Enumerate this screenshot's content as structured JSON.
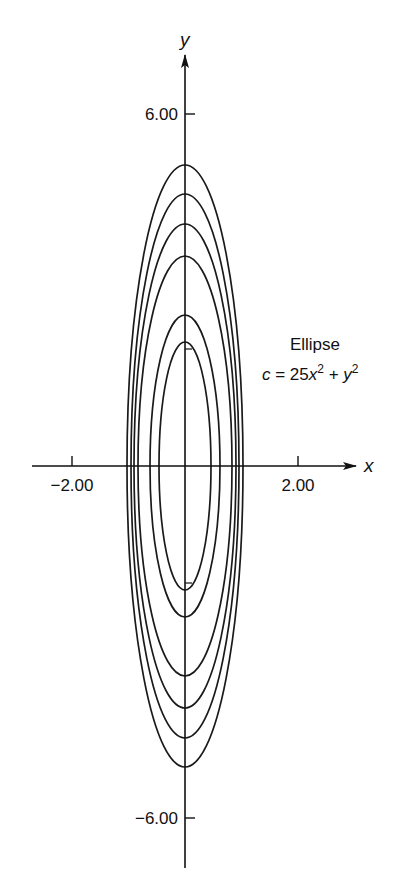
{
  "chart_data": {
    "type": "line",
    "subtype": "contour-ellipses",
    "title": "",
    "xlabel": "x",
    "ylabel": "y",
    "x_ticks": [
      {
        "value": -2.0,
        "label": "-2.00"
      },
      {
        "value": 2.0,
        "label": "2.00"
      }
    ],
    "y_ticks": [
      {
        "value": 6.0,
        "label": "6.00"
      },
      {
        "value": -6.0,
        "label": "-6.00"
      }
    ],
    "xlim": [
      -3.2,
      3.5
    ],
    "ylim": [
      -6.9,
      7.9
    ],
    "grid": false,
    "legend": null,
    "annotation": {
      "title": "Ellipse",
      "equation": "c = 25x² + y²"
    },
    "series": [
      {
        "name": "c≈26.3",
        "c": 26.3,
        "semi_x": 1.03,
        "semi_y": 5.13
      },
      {
        "name": "c≈21.4",
        "c": 21.4,
        "semi_x": 0.93,
        "semi_y": 4.63
      },
      {
        "name": "c≈17.0",
        "c": 17.0,
        "semi_x": 0.83,
        "semi_y": 4.12
      },
      {
        "name": "c≈12.8",
        "c": 12.8,
        "semi_x": 0.72,
        "semi_y": 3.58
      },
      {
        "name": "c≈6.6",
        "c": 6.6,
        "semi_x": 0.51,
        "semi_y": 2.57
      },
      {
        "name": "c≈4.5",
        "c": 4.5,
        "semi_x": 0.42,
        "semi_y": 2.11
      }
    ]
  },
  "labels": {
    "x_axis": "x",
    "y_axis": "y",
    "tick_x_neg": "−2.00",
    "tick_x_pos": "2.00",
    "tick_y_pos": "6.00",
    "tick_y_neg": "−6.00",
    "annot_title": "Ellipse",
    "annot_c": "c",
    "annot_eq_mid": " = 25",
    "annot_x": "x",
    "annot_plus": " + ",
    "annot_y": "y",
    "annot_sup": "2"
  },
  "layout": {
    "origin_px": [
      185,
      466
    ],
    "x_px_per_unit": 56.5,
    "y_px_per_unit": 58.7,
    "ellipses_px": [
      {
        "rx": 58,
        "ry": 301
      },
      {
        "rx": 54,
        "ry": 272
      },
      {
        "rx": 51,
        "ry": 242
      },
      {
        "rx": 47,
        "ry": 210
      },
      {
        "rx": 35,
        "ry": 151
      },
      {
        "rx": 26,
        "ry": 124
      }
    ],
    "line_color": "#1a1a1a"
  }
}
